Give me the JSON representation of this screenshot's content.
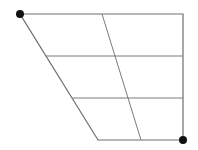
{
  "diagram": {
    "type": "trapezoid-grid",
    "width": 198,
    "height": 150,
    "colors": {
      "background": "#ffffff",
      "line": "#7a7a7a",
      "outline": "#6e6e6e",
      "dot": "#111111"
    },
    "outline": {
      "top_left": [
        20,
        14
      ],
      "top_right": [
        183,
        14
      ],
      "bottom_right": [
        183,
        140
      ],
      "bottom_left": [
        98,
        140
      ]
    },
    "inner_slant": {
      "top": [
        102,
        14
      ],
      "bottom": [
        141,
        140
      ]
    },
    "horizontal_lines": [
      {
        "y": 56,
        "x1": 46,
        "x2": 183
      },
      {
        "y": 98,
        "x1": 72,
        "x2": 183
      }
    ],
    "dots": [
      {
        "name": "top-left-vertex",
        "x": 20,
        "y": 14,
        "r": 4
      },
      {
        "name": "bottom-right-vertex",
        "x": 183,
        "y": 140,
        "r": 4
      }
    ]
  }
}
